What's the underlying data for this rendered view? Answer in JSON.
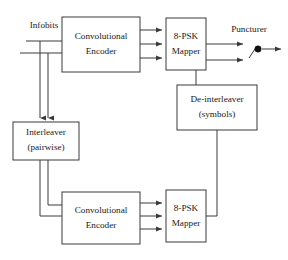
{
  "figure": {
    "type": "block-diagram",
    "domain": "communications",
    "background_color": "#ffffff",
    "line_color": "#3a3a3a",
    "text_color": "#1a1a1a"
  },
  "labels": {
    "infobits": "Infobits",
    "puncturer": "Puncturer"
  },
  "blocks": [
    {
      "id": "conv-encoder-top",
      "line1": "Convolutional",
      "line2": "Encoder",
      "x": 62,
      "y": 17,
      "w": 78,
      "h": 55
    },
    {
      "id": "psk-mapper-top",
      "line1": "8-PSK",
      "line2": "Mapper",
      "x": 166,
      "y": 18,
      "w": 40,
      "h": 52
    },
    {
      "id": "de-interleaver",
      "line1": "De-interleaver",
      "line2": "(symbols)",
      "x": 177,
      "y": 85,
      "w": 80,
      "h": 45
    },
    {
      "id": "interleaver",
      "line1": "Interleaver",
      "line2": "(pairwise)",
      "x": 13,
      "y": 122,
      "w": 66,
      "h": 38
    },
    {
      "id": "conv-encoder-bottom",
      "line1": "Convolutional",
      "line2": "Encoder",
      "x": 62,
      "y": 192,
      "w": 78,
      "h": 52
    },
    {
      "id": "psk-mapper-bottom",
      "line1": "8-PSK",
      "line2": "Mapper",
      "x": 166,
      "y": 190,
      "w": 40,
      "h": 52
    }
  ],
  "switch": {
    "id": "puncturer-switch",
    "node_x": 258,
    "node_y": 49,
    "node_r": 3.2
  }
}
